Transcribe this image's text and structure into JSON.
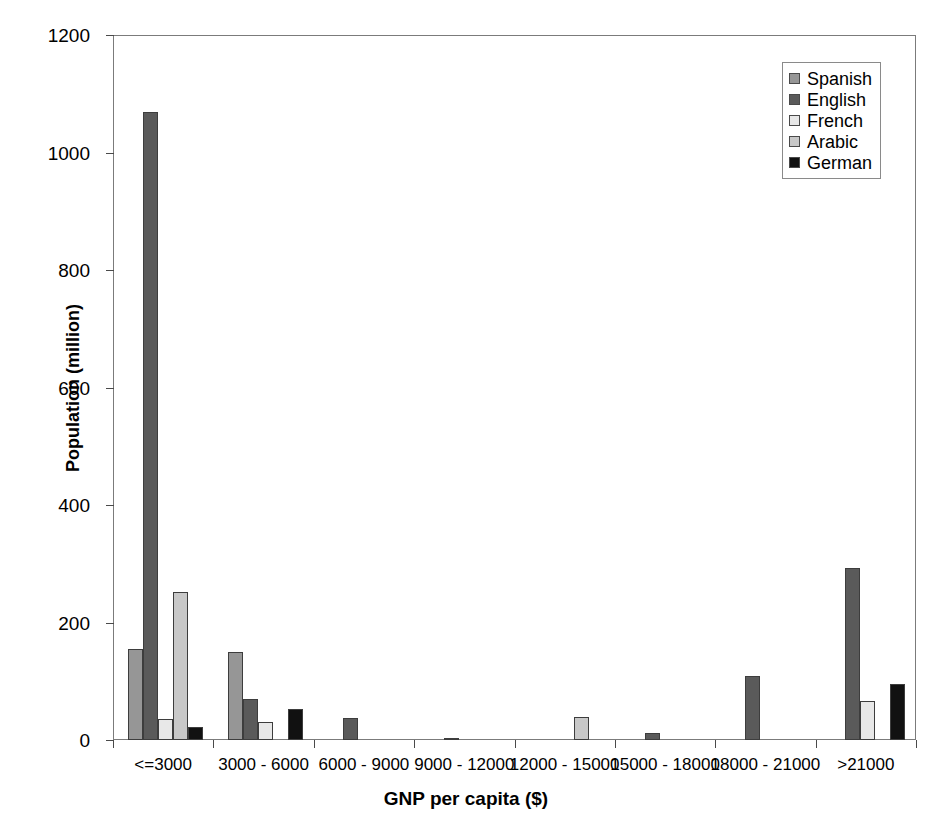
{
  "chart_data": {
    "type": "bar",
    "title": "",
    "xlabel": "GNP per capita ($)",
    "ylabel": "Population (million)",
    "ylim": [
      0,
      1200
    ],
    "yticks": [
      0,
      200,
      400,
      600,
      800,
      1000,
      1200
    ],
    "grid": false,
    "legend_position": "top-right",
    "categories": [
      "<=3000",
      "3000 - 6000",
      "6000 - 9000",
      "9000 - 12000",
      "12000 - 15000",
      "15000 - 18000",
      "18000 - 21000",
      ">21000"
    ],
    "series": [
      {
        "name": "Spanish",
        "color": "#969696",
        "values": [
          155,
          150,
          0,
          0,
          0,
          0,
          0,
          0
        ]
      },
      {
        "name": "English",
        "color": "#5a5a5a",
        "values": [
          1069,
          69,
          37,
          3,
          0,
          12,
          109,
          292
        ]
      },
      {
        "name": "French",
        "color": "#e8e8e8",
        "values": [
          35,
          30,
          0,
          0,
          0,
          0,
          0,
          67
        ]
      },
      {
        "name": "Arabic",
        "color": "#c8c8c8",
        "values": [
          252,
          0,
          0,
          0,
          40,
          0,
          0,
          0
        ]
      },
      {
        "name": "German",
        "color": "#111111",
        "values": [
          22,
          53,
          0,
          0,
          0,
          0,
          0,
          96
        ]
      }
    ]
  },
  "axis": {
    "y_title": "Population (million)",
    "x_title": "GNP per capita ($)"
  },
  "legend": {
    "items": [
      {
        "label": "Spanish",
        "swatch": "#969696"
      },
      {
        "label": "English",
        "swatch": "#5a5a5a"
      },
      {
        "label": "French",
        "swatch": "#e8e8e8"
      },
      {
        "label": "Arabic",
        "swatch": "#c8c8c8"
      },
      {
        "label": "German",
        "swatch": "#111111"
      }
    ]
  }
}
